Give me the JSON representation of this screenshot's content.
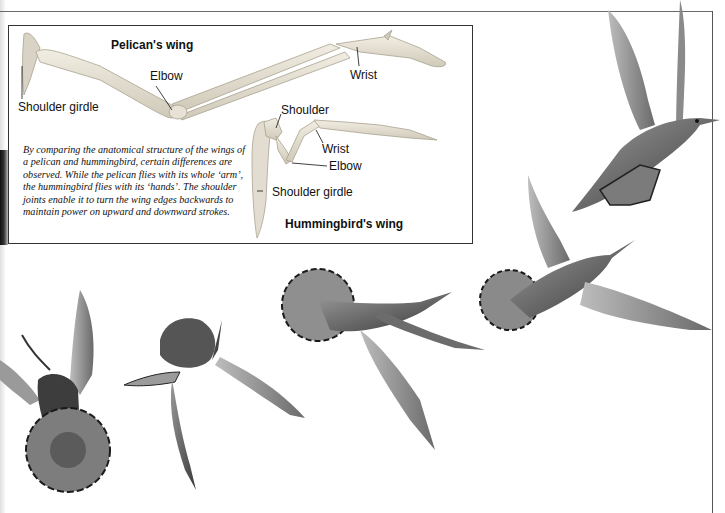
{
  "figure": {
    "pelican_wing": {
      "title": "Pelican's wing",
      "labels": {
        "shoulder_girdle": "Shoulder girdle",
        "elbow": "Elbow",
        "wrist": "Wrist"
      }
    },
    "hummingbird_wing": {
      "title": "Hummingbird's wing",
      "labels": {
        "shoulder": "Shoulder",
        "wrist": "Wrist",
        "elbow": "Elbow",
        "shoulder_girdle": "Shoulder girdle"
      }
    },
    "caption": "By comparing the anatomical structure of the wings of a pelican and hummingbird, certain differences are observed. While the pelican flies with its whole ‘arm’, the hummingbird flies with its ‘hands’. The shoulder joints enable it to turn the wing edges backwards to maintain power on upward and downward strokes.",
    "illustrations": [
      {
        "name": "hummingbird-hovering-front"
      },
      {
        "name": "hummingbird-hovering-head-down"
      },
      {
        "name": "hummingbird-flying-tail-fanned"
      },
      {
        "name": "hummingbird-flying-wings-spread"
      },
      {
        "name": "hummingbird-flying-upward"
      }
    ],
    "colors": {
      "bone": "#e6e1d3",
      "bone_shadow": "#b9b3a3",
      "feather_dark": "#2e2e2e",
      "feather_mid": "#6d6d6d",
      "feather_light": "#a9a9a9",
      "rule": "#555555"
    }
  }
}
